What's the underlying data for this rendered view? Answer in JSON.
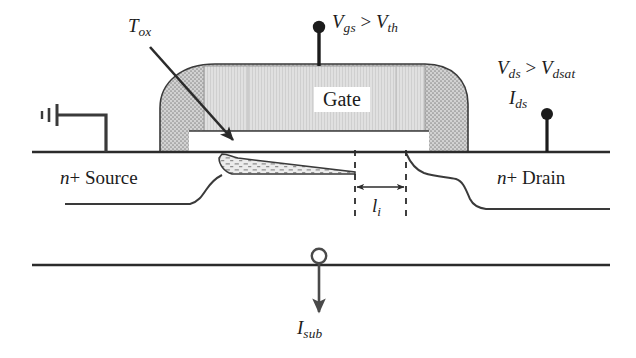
{
  "figure": {
    "type": "semiconductor-device-cross-section"
  },
  "labels": {
    "tox": {
      "base": "T",
      "sub": "ox",
      "full": "T_ox"
    },
    "gate": "Gate",
    "vgs": {
      "v1": "V",
      "sub1": "gs",
      "op": " > ",
      "v2": "V",
      "sub2": "th",
      "full": "V_gs > V_th"
    },
    "vds": {
      "v1": "V",
      "sub1": "ds",
      "op": " > ",
      "v2": "V",
      "sub2": "dsat",
      "full": "V_ds > V_dsat"
    },
    "ids": {
      "base": "I",
      "sub": "ds",
      "full": "I_ds"
    },
    "isub": {
      "base": "I",
      "sub": "sub",
      "full": "I_sub"
    },
    "source": {
      "prefix": "n",
      "plus": "+ ",
      "text": "Source",
      "full": "n+ Source"
    },
    "drain": {
      "prefix": "n",
      "plus": "+ ",
      "text": "Drain",
      "full": "n+ Drain"
    },
    "li": {
      "base": "l",
      "sub": "i",
      "full": "l_i"
    }
  },
  "colors": {
    "ink": "#1c1c1c",
    "line": "#2b2b2b",
    "spacer_fill": "#c9c9c9",
    "gate_fill": "#dcdcdc",
    "channel_fill": "#e4e4e4",
    "background": "#ffffff"
  },
  "terminals": [
    {
      "name": "gate-terminal",
      "style": "filled-dot",
      "signal": "V_gs > V_th"
    },
    {
      "name": "drain-terminal",
      "style": "filled-dot",
      "signal": "V_ds > V_dsat / I_ds"
    },
    {
      "name": "substrate-terminal",
      "style": "open-circle",
      "signal": "I_sub"
    },
    {
      "name": "body-ground",
      "style": "ground-symbol",
      "signal": "ground"
    }
  ],
  "annotations": {
    "pinch_off_marker": "l_i",
    "oxide_thickness_marker": "T_ox",
    "substrate_current_direction": "down"
  }
}
